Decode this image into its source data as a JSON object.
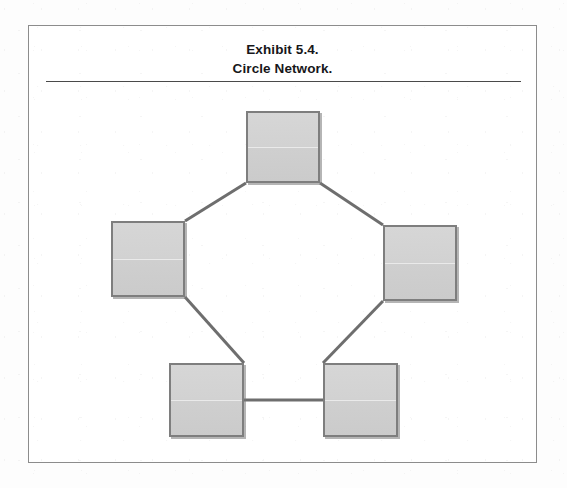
{
  "exhibit": {
    "title_line_1": "Exhibit 5.4.",
    "title_line_2": "Circle Network.",
    "frame": {
      "x": 28,
      "y": 25,
      "width": 509,
      "height": 438
    },
    "rule": {
      "x": 17,
      "y": 55,
      "width": 475
    }
  },
  "colors": {
    "page_background": "#fdfdfd",
    "frame_border": "#8c8c8c",
    "title_text": "#17171a",
    "rule": "#4a4a4a",
    "node_fill": "#d2d2d2",
    "node_border": "#7e7e7e",
    "node_shadow": "#787878",
    "edge_stroke": "#6e6e6e"
  },
  "diagram": {
    "type": "node-link-network",
    "topology": "circle",
    "node_count": 5,
    "edge_count": 5,
    "node_label": "",
    "nodes": [
      {
        "id": "n1",
        "name": "node-top",
        "x": 217,
        "y": 85,
        "width": 74,
        "height": 72,
        "label": ""
      },
      {
        "id": "n2",
        "name": "node-left",
        "x": 82,
        "y": 195,
        "width": 74,
        "height": 76,
        "label": ""
      },
      {
        "id": "n3",
        "name": "node-right",
        "x": 354,
        "y": 199,
        "width": 74,
        "height": 76,
        "label": ""
      },
      {
        "id": "n4",
        "name": "node-bottom-left",
        "x": 140,
        "y": 337,
        "width": 75,
        "height": 74,
        "label": ""
      },
      {
        "id": "n5",
        "name": "node-bottom-right",
        "x": 294,
        "y": 337,
        "width": 75,
        "height": 74,
        "label": ""
      }
    ],
    "edges": [
      {
        "id": "e1",
        "name": "edge-top-to-left",
        "from": "n1",
        "to": "n2",
        "x1": 217,
        "y1": 157,
        "x2": 156,
        "y2": 195
      },
      {
        "id": "e2",
        "name": "edge-top-to-right",
        "from": "n1",
        "to": "n3",
        "x1": 291,
        "y1": 157,
        "x2": 354,
        "y2": 199
      },
      {
        "id": "e3",
        "name": "edge-left-to-bottom-left",
        "from": "n2",
        "to": "n4",
        "x1": 156,
        "y1": 271,
        "x2": 215,
        "y2": 337
      },
      {
        "id": "e4",
        "name": "edge-right-to-bottom-right",
        "from": "n3",
        "to": "n5",
        "x1": 354,
        "y1": 275,
        "x2": 294,
        "y2": 337
      },
      {
        "id": "e5",
        "name": "edge-bottom-left-to-bottom-right",
        "from": "n4",
        "to": "n5",
        "x1": 215,
        "y1": 374,
        "x2": 294,
        "y2": 374
      }
    ]
  }
}
